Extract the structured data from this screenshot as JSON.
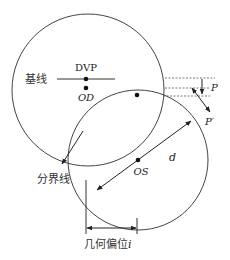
{
  "diagram": {
    "type": "geometric offset diagram",
    "colors": {
      "stroke": "#333333",
      "dashed": "#555555",
      "background": "#ffffff"
    },
    "shapes": {
      "circle_upper": {
        "cx": 88,
        "cy": 90,
        "r": 76
      },
      "circle_lower": {
        "cx": 138,
        "cy": 160,
        "r": 70
      }
    },
    "labels": {
      "dvp": "DVP",
      "od": "OD",
      "baseline": "基线",
      "boundary": "分界线",
      "os": "OS",
      "diameter": "d",
      "p": "P",
      "p_prime": "P′",
      "offset": "几何偏位",
      "offset_var": "i"
    },
    "points": [
      {
        "name": "DVP",
        "x": 86,
        "y": 79
      },
      {
        "name": "OD",
        "x": 86,
        "y": 88
      },
      {
        "name": "lower-circle-top",
        "x": 137,
        "y": 95
      },
      {
        "name": "OS",
        "x": 138,
        "y": 160
      }
    ]
  }
}
